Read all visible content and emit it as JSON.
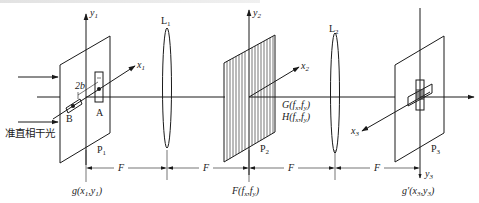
{
  "diagram": {
    "type": "4f optical correlator / spatial filtering system",
    "input_light_label": "准直相干光",
    "planes": [
      {
        "id": "P1",
        "label": "P",
        "sub": "1",
        "axes": {
          "x": "x1",
          "y": "y1"
        },
        "function_label": "g(x1,y1)",
        "function_main": "g(",
        "function_args": [
          {
            "t": "x",
            "s": "1"
          },
          {
            "t": "y",
            "s": "1"
          }
        ]
      },
      {
        "id": "P2",
        "label": "P",
        "sub": "2",
        "axes": {
          "x": "x2",
          "y": "y2"
        },
        "function_label": "F(fx,fy)",
        "spectrum_labels": [
          "G(fx,fy)",
          "H(fx,fy)"
        ]
      },
      {
        "id": "P3",
        "label": "P",
        "sub": "3",
        "axes": {
          "x": "x3",
          "y": "y3"
        },
        "function_label": "g'(x3,y3)"
      }
    ],
    "lenses": [
      {
        "id": "L1",
        "label": "L",
        "sub": "1"
      },
      {
        "id": "L2",
        "label": "L",
        "sub": "2"
      }
    ],
    "apertures": [
      {
        "id": "A",
        "label": "A"
      },
      {
        "id": "B",
        "label": "B"
      }
    ],
    "separation_label": "2b",
    "distances": [
      "F",
      "F",
      "F",
      "F"
    ],
    "axis_labels": {
      "y1": {
        "t": "y",
        "s": "1"
      },
      "x1": {
        "t": "x",
        "s": "1"
      },
      "y2": {
        "t": "y",
        "s": "2"
      },
      "x2": {
        "t": "x",
        "s": "2"
      },
      "x3": {
        "t": "x",
        "s": "3"
      },
      "y3": {
        "t": "y",
        "s": "3"
      }
    },
    "bottom_labels": {
      "g": "g(x₁,y₁)",
      "F": "F(fₓ,fᵧ)",
      "gp": "g′(x₃,y₃)"
    }
  }
}
